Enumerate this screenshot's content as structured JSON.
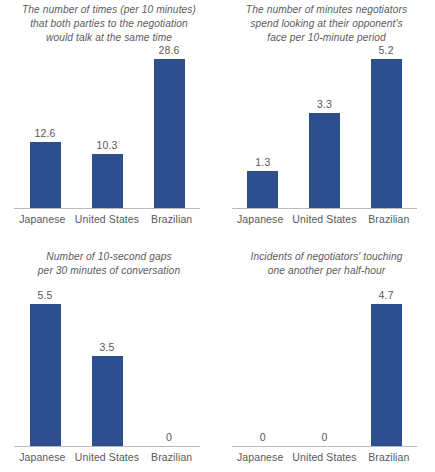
{
  "page": {
    "background_color": "#ffffff",
    "bar_color": "#2d4f8e",
    "text_color": "#58595b",
    "axis_color": "#b8b9bb"
  },
  "chart_data": [
    {
      "type": "bar",
      "position": "top-left",
      "title": "The number of times (per 10 minutes)\nthat both parties to the negotiation\nwould talk at the same time",
      "xlabel": "",
      "ylabel": "",
      "categories": [
        "Japanese",
        "United States",
        "Brazilian"
      ],
      "values": [
        12.6,
        10.3,
        28.6
      ],
      "value_labels": [
        "12.6",
        "10.3",
        "28.6"
      ],
      "ylim": [
        0,
        28.6
      ],
      "grid": false,
      "legend": false
    },
    {
      "type": "bar",
      "position": "top-right",
      "title": "The number of minutes negotiators\nspend looking at their opponent's\nface per 10-minute period",
      "xlabel": "",
      "ylabel": "",
      "categories": [
        "Japanese",
        "United States",
        "Brazilian"
      ],
      "values": [
        1.3,
        3.3,
        5.2
      ],
      "value_labels": [
        "1.3",
        "3.3",
        "5.2"
      ],
      "ylim": [
        0,
        5.2
      ],
      "grid": false,
      "legend": false
    },
    {
      "type": "bar",
      "position": "bottom-left",
      "title": "Number of 10-second gaps\nper 30 minutes of conversation",
      "xlabel": "",
      "ylabel": "",
      "categories": [
        "Japanese",
        "United States",
        "Brazilian"
      ],
      "values": [
        5.5,
        3.5,
        0
      ],
      "value_labels": [
        "5.5",
        "3.5",
        "0"
      ],
      "ylim": [
        0,
        5.5
      ],
      "grid": false,
      "legend": false
    },
    {
      "type": "bar",
      "position": "bottom-right",
      "title": "Incidents of negotiators' touching\none another per half-hour",
      "xlabel": "",
      "ylabel": "",
      "categories": [
        "Japanese",
        "United States",
        "Brazilian"
      ],
      "values": [
        0,
        0,
        4.7
      ],
      "value_labels": [
        "0",
        "0",
        "4.7"
      ],
      "ylim": [
        0,
        4.7
      ],
      "grid": false,
      "legend": false
    }
  ]
}
